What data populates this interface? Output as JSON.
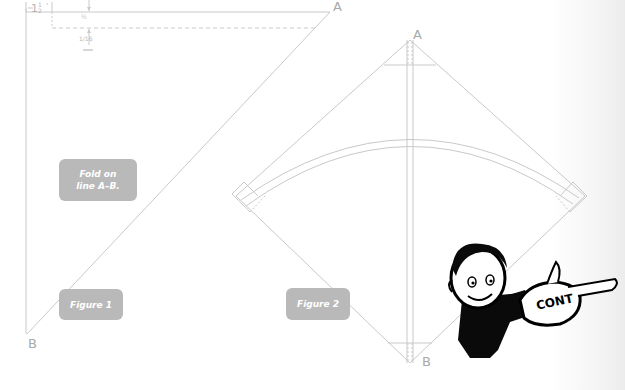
{
  "figure1": {
    "caption": "Figure 1",
    "note": "Fold on line A–B.",
    "point_a": "A",
    "point_b": "B",
    "dimensions": {
      "top_margin": "1½\"",
      "fold_offset": "½\"",
      "fold_depth": "1/16\""
    }
  },
  "figure2": {
    "caption": "Figure 2",
    "point_a": "A",
    "point_b": "B"
  },
  "mascot": {
    "sign_text": "CONT"
  },
  "colors": {
    "line": "#c8c8c8",
    "label_box": "#b9b9b9",
    "label_text": "#ffffff",
    "ink": "#000000"
  }
}
